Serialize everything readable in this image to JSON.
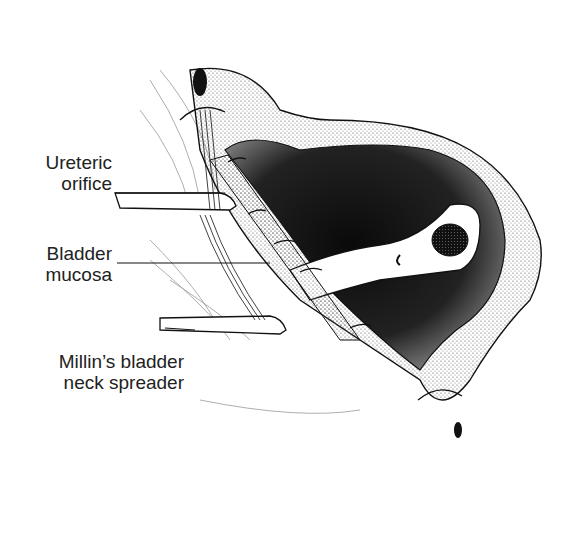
{
  "figure": {
    "type": "surgical illustration",
    "labels": [
      {
        "id": "ureteric-orifice",
        "line1": "Ureteric",
        "line2": "orifice"
      },
      {
        "id": "bladder-mucosa",
        "line1": "Bladder",
        "line2": "mucosa"
      },
      {
        "id": "millins-spreader",
        "line1": "Millin’s bladder",
        "line2": "neck spreader"
      }
    ],
    "colors": {
      "ink": "#111111",
      "background": "#ffffff",
      "stipple": "#333333"
    }
  }
}
